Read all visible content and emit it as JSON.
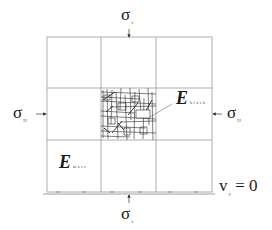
{
  "diagram": {
    "type": "rock mass block loading schematic",
    "grid": {
      "rows": 3,
      "cols": 3,
      "line_color": "#9a9a9a",
      "bounds": {
        "left": 47,
        "top": 37,
        "right": 212,
        "bottom": 192
      }
    },
    "center_block": {
      "texture": "fractured-rock-pattern",
      "color": "#333333"
    },
    "labels": {
      "sigma_top": {
        "symbol": "σ",
        "subscript": "v"
      },
      "sigma_bottom": {
        "symbol": "σ",
        "subscript": "v"
      },
      "sigma_left": {
        "symbol": "σ",
        "subscript": "H"
      },
      "sigma_right": {
        "symbol": "σ",
        "subscript": "H"
      },
      "e_block": {
        "symbol": "E",
        "subscript": "block"
      },
      "e_mass": {
        "symbol": "E",
        "subscript": "mass"
      },
      "boundary_condition": {
        "symbol": "v",
        "subscript": "y",
        "equation": "= 0"
      }
    }
  }
}
